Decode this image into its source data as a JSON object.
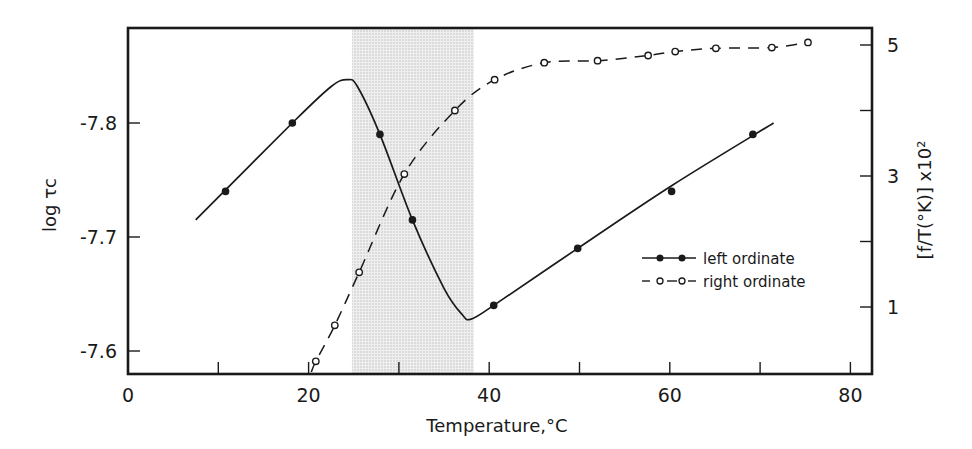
{
  "chart_data": {
    "type": "line",
    "title": "",
    "xlabel": "Temperature,°C",
    "ylabel": "log τc",
    "y2label": "[f/T(°K)] x10²",
    "xlim": [
      0,
      83
    ],
    "ylim": [
      -7.875,
      -7.578
    ],
    "y_inverted": true,
    "y2lim": [
      -1.0,
      5.3
    ],
    "x_ticks": [
      0,
      10,
      20,
      30,
      40,
      50,
      60,
      70,
      80
    ],
    "x_tick_labels": [
      "0",
      "",
      "20",
      "",
      "40",
      "",
      "60",
      "",
      "80"
    ],
    "y_ticks": [
      -7.8,
      -7.7,
      -7.6
    ],
    "y_tick_labels": [
      "-7.8",
      "-7.7",
      "-7.6"
    ],
    "y2_ticks": [
      1,
      2,
      3,
      4,
      5
    ],
    "y2_tick_labels": [
      "1",
      "",
      "3",
      "",
      "5"
    ],
    "grid": false,
    "legend_position": "lower right inside",
    "shaded_region": {
      "x_start": 24.8,
      "x_end": 38.3,
      "color": "#d9d9d9"
    },
    "series": [
      {
        "name": "left ordinate",
        "axis": "left",
        "marker": "filled-circle",
        "line_style": "solid",
        "points": [
          {
            "x": 10.8,
            "y": -7.74
          },
          {
            "x": 18.2,
            "y": -7.8
          },
          {
            "x": 27.9,
            "y": -7.79
          },
          {
            "x": 31.5,
            "y": -7.715
          },
          {
            "x": 40.5,
            "y": -7.64
          },
          {
            "x": 49.8,
            "y": -7.69
          },
          {
            "x": 60.2,
            "y": -7.74
          },
          {
            "x": 69.2,
            "y": -7.79
          }
        ],
        "curve": [
          {
            "x": 7.5,
            "y": -7.715
          },
          {
            "x": 18.2,
            "y": -7.8
          },
          {
            "x": 22.5,
            "y": -7.832
          },
          {
            "x": 24.3,
            "y": -7.838
          },
          {
            "x": 25.4,
            "y": -7.832
          },
          {
            "x": 27.9,
            "y": -7.79
          },
          {
            "x": 31.5,
            "y": -7.715
          },
          {
            "x": 35.0,
            "y": -7.655
          },
          {
            "x": 37.0,
            "y": -7.632
          },
          {
            "x": 38.0,
            "y": -7.628
          },
          {
            "x": 40.5,
            "y": -7.64
          },
          {
            "x": 49.8,
            "y": -7.69
          },
          {
            "x": 60.2,
            "y": -7.745
          },
          {
            "x": 71.5,
            "y": -7.8
          }
        ]
      },
      {
        "name": "right ordinate",
        "axis": "right",
        "marker": "open-circle",
        "line_style": "dashed",
        "points": [
          {
            "x": 20.8,
            "y": 0.17
          },
          {
            "x": 22.9,
            "y": 0.72
          },
          {
            "x": 25.6,
            "y": 1.53
          },
          {
            "x": 30.6,
            "y": 3.03
          },
          {
            "x": 36.2,
            "y": 4.0
          },
          {
            "x": 40.6,
            "y": 4.47
          },
          {
            "x": 46.1,
            "y": 4.73
          },
          {
            "x": 52.0,
            "y": 4.76
          },
          {
            "x": 57.6,
            "y": 4.84
          },
          {
            "x": 60.6,
            "y": 4.9
          },
          {
            "x": 65.1,
            "y": 4.95
          },
          {
            "x": 71.3,
            "y": 4.96
          },
          {
            "x": 75.3,
            "y": 5.04
          }
        ]
      }
    ]
  },
  "legend": {
    "items": [
      {
        "label": "left ordinate",
        "style": "solid-filled"
      },
      {
        "label": "right ordinate",
        "style": "dashed-open"
      }
    ]
  },
  "layout": {
    "plot_left": 128,
    "plot_right": 872,
    "plot_top": 28,
    "plot_bottom": 374,
    "x_px_per_unit": 9.03,
    "y_ref_px": 237,
    "y_ref_val": -7.7,
    "y_px_per_unit": 1140,
    "y2_ref_px": 307,
    "y2_ref_val": 1,
    "y2_px_per_unit": 65.5
  }
}
